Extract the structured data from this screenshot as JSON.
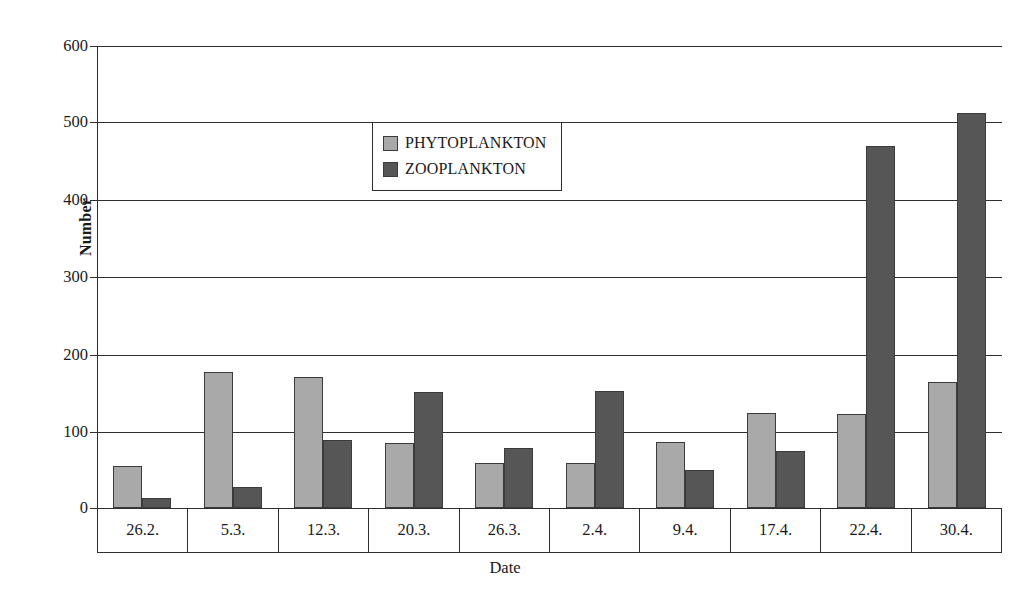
{
  "chart_data": {
    "type": "bar",
    "title": "",
    "xlabel": "Date",
    "ylabel": "Number",
    "ylim": [
      0,
      600
    ],
    "yticks": [
      600,
      500,
      400,
      300,
      200,
      100,
      0
    ],
    "grid": true,
    "legend_position": "upper-center",
    "categories": [
      "26.2.",
      "5.3.",
      "12.3.",
      "20.3.",
      "26.3.",
      "2.4.",
      "9.4.",
      "17.4.",
      "22.4.",
      "30.4."
    ],
    "series": [
      {
        "name": "PHYTOPLANKTON",
        "color": "#a9a9a9",
        "values": [
          54,
          177,
          170,
          85,
          59,
          59,
          86,
          124,
          122,
          164
        ]
      },
      {
        "name": "ZOOPLANKTON",
        "color": "#565656",
        "values": [
          13,
          27,
          88,
          151,
          78,
          152,
          49,
          74,
          470,
          513
        ]
      }
    ]
  },
  "legend": {
    "items": [
      {
        "label": "PHYTOPLANKTON",
        "swatch": "phyto"
      },
      {
        "label": "ZOOPLANKTON",
        "swatch": "zoo"
      }
    ]
  },
  "axes": {
    "y_title": "Number",
    "x_title": "Date",
    "y_tick_labels": [
      "600",
      "500",
      "400",
      "300",
      "200",
      "100",
      "0"
    ]
  }
}
